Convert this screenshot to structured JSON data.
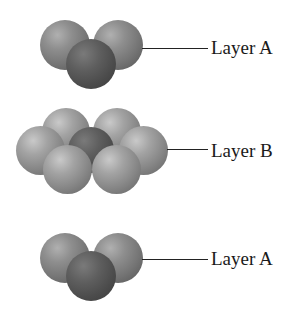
{
  "diagram": {
    "title": "",
    "layers": [
      {
        "id": "top",
        "label": "Layer A",
        "sphere_count": 3
      },
      {
        "id": "middle",
        "label": "Layer B",
        "sphere_count": 7
      },
      {
        "id": "bottom",
        "label": "Layer A",
        "sphere_count": 3
      }
    ],
    "colors": {
      "sphere_light": "#999999",
      "sphere_dark": "#4c4c4c",
      "leader_line": "#222222",
      "label_text": "#1a1a1a",
      "background": "#ffffff"
    }
  }
}
